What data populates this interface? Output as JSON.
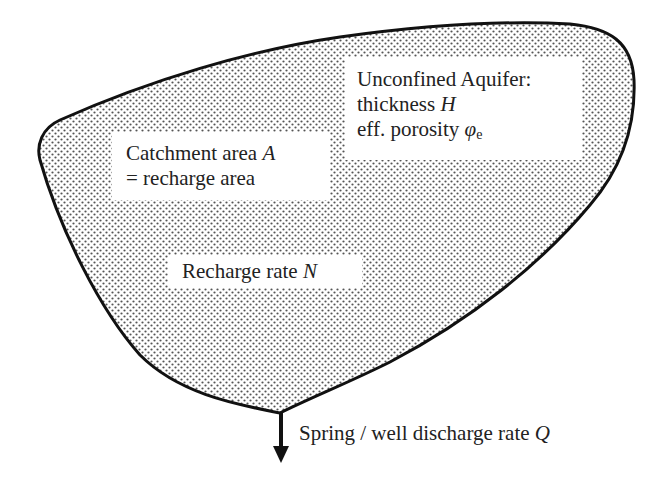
{
  "diagram": {
    "shape": "catchment-aquifer-outline",
    "fill_pattern": "dot-stipple",
    "colors": {
      "background": "#ffffff",
      "outline": "#111111",
      "dot": "#555555",
      "label_background": "#ffffff",
      "text": "#222222"
    },
    "labels": {
      "aquifer": {
        "line1": "Unconfined Aquifer:",
        "line2_text": "thickness ",
        "line2_symbol": "H",
        "line3_text": "eff. porosity ",
        "line3_symbol": "φ",
        "line3_subscript": "e"
      },
      "catchment": {
        "line1_text": "Catchment area ",
        "line1_symbol": "A",
        "line2": "= recharge area"
      },
      "recharge": {
        "text": "Recharge rate ",
        "symbol": "N"
      },
      "discharge": {
        "text": "Spring / well discharge rate ",
        "symbol": "Q"
      }
    },
    "arrow": {
      "direction": "down",
      "meaning": "discharge-outflow"
    }
  }
}
